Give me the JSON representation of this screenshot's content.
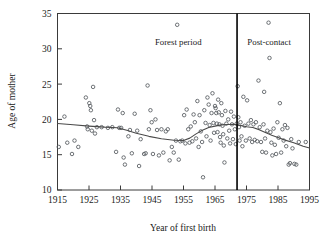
{
  "chart_data": {
    "type": "scatter",
    "title": "",
    "xlabel": "Year of first birth",
    "ylabel": "Age of mother",
    "xlim": [
      1915,
      1995
    ],
    "ylim": [
      10,
      35
    ],
    "xticks": [
      1915,
      1925,
      1935,
      1945,
      1955,
      1965,
      1975,
      1985,
      1995
    ],
    "xtick_labels": [
      "1915",
      "1925",
      "1935",
      "1945",
      "1955",
      "1965",
      "1975",
      "1985",
      "1995"
    ],
    "yticks": [
      10,
      15,
      20,
      25,
      30,
      35
    ],
    "ytick_labels": [
      "10",
      "15",
      "20",
      "25",
      "30",
      "35"
    ],
    "grid": false,
    "legend": "none",
    "marker": "open-circle",
    "annotations": [
      {
        "name": "forest-period-label",
        "text": "Forest period",
        "x": 1962,
        "y": 30.6,
        "align": "end"
      },
      {
        "name": "post-contact-label",
        "text": "Post-contact",
        "x": 1974,
        "y": 30.6,
        "align": "start"
      }
    ],
    "vline": {
      "name": "period-divider",
      "x": 1972,
      "label": "period boundary"
    },
    "series": [
      {
        "name": "Age of mother at first birth",
        "points": [
          [
            1915.4,
            16.1
          ],
          [
            1917.2,
            20.4
          ],
          [
            1918.1,
            16.7
          ],
          [
            1919.6,
            15.1
          ],
          [
            1920.4,
            17.0
          ],
          [
            1921.6,
            16.1
          ],
          [
            1924.0,
            23.1
          ],
          [
            1924.4,
            19.0
          ],
          [
            1924.6,
            18.6
          ],
          [
            1925.1,
            22.3
          ],
          [
            1925.4,
            21.9
          ],
          [
            1925.6,
            21.3
          ],
          [
            1925.9,
            18.4
          ],
          [
            1926.3,
            24.6
          ],
          [
            1926.6,
            19.9
          ],
          [
            1926.9,
            18.0
          ],
          [
            1927.5,
            18.9
          ],
          [
            1929.0,
            18.9
          ],
          [
            1931.0,
            18.8
          ],
          [
            1932.4,
            18.9
          ],
          [
            1933.6,
            15.4
          ],
          [
            1934.2,
            21.4
          ],
          [
            1934.6,
            18.8
          ],
          [
            1935.2,
            18.8
          ],
          [
            1935.7,
            20.9
          ],
          [
            1936.0,
            14.6
          ],
          [
            1936.4,
            13.6
          ],
          [
            1937.5,
            17.6
          ],
          [
            1938.0,
            18.5
          ],
          [
            1938.6,
            15.2
          ],
          [
            1939.5,
            20.8
          ],
          [
            1940.3,
            18.4
          ],
          [
            1940.9,
            13.4
          ],
          [
            1941.4,
            17.2
          ],
          [
            1942.5,
            15.1
          ],
          [
            1943.0,
            15.2
          ],
          [
            1943.6,
            24.8
          ],
          [
            1944.0,
            18.6
          ],
          [
            1944.5,
            21.3
          ],
          [
            1944.9,
            19.6
          ],
          [
            1945.3,
            15.1
          ],
          [
            1946.1,
            20.0
          ],
          [
            1946.6,
            18.5
          ],
          [
            1947.2,
            14.9
          ],
          [
            1948.0,
            18.6
          ],
          [
            1948.6,
            15.3
          ],
          [
            1949.4,
            18.3
          ],
          [
            1950.0,
            18.6
          ],
          [
            1950.6,
            14.2
          ],
          [
            1951.3,
            16.1
          ],
          [
            1951.9,
            15.3
          ],
          [
            1952.6,
            17.0
          ],
          [
            1953.0,
            33.4
          ],
          [
            1953.5,
            14.3
          ],
          [
            1954.0,
            16.9
          ],
          [
            1954.6,
            17.0
          ],
          [
            1955.2,
            20.6
          ],
          [
            1955.6,
            16.6
          ],
          [
            1956.0,
            21.4
          ],
          [
            1956.5,
            18.6
          ],
          [
            1956.9,
            16.7
          ],
          [
            1957.3,
            19.0
          ],
          [
            1957.8,
            16.9
          ],
          [
            1958.2,
            20.7
          ],
          [
            1958.6,
            19.6
          ],
          [
            1959.0,
            17.3
          ],
          [
            1959.4,
            22.6
          ],
          [
            1959.8,
            16.1
          ],
          [
            1960.1,
            20.6
          ],
          [
            1960.5,
            18.3
          ],
          [
            1960.9,
            16.8
          ],
          [
            1961.2,
            11.8
          ],
          [
            1961.6,
            21.3
          ],
          [
            1962.0,
            19.5
          ],
          [
            1962.3,
            17.6
          ],
          [
            1962.6,
            23.1
          ],
          [
            1963.0,
            22.1
          ],
          [
            1963.3,
            19.2
          ],
          [
            1963.6,
            17.0
          ],
          [
            1963.9,
            20.9
          ],
          [
            1964.2,
            23.7
          ],
          [
            1964.5,
            19.5
          ],
          [
            1964.7,
            18.1
          ],
          [
            1965.0,
            21.9
          ],
          [
            1965.2,
            21.6
          ],
          [
            1965.4,
            20.9
          ],
          [
            1965.6,
            19.4
          ],
          [
            1965.8,
            18.2
          ],
          [
            1966.0,
            22.8
          ],
          [
            1966.2,
            21.0
          ],
          [
            1966.4,
            19.3
          ],
          [
            1966.6,
            17.5
          ],
          [
            1966.8,
            16.7
          ],
          [
            1967.0,
            22.3
          ],
          [
            1967.2,
            20.6
          ],
          [
            1967.4,
            19.1
          ],
          [
            1967.6,
            17.9
          ],
          [
            1967.8,
            16.3
          ],
          [
            1968.0,
            13.9
          ],
          [
            1968.3,
            21.2
          ],
          [
            1968.6,
            19.4
          ],
          [
            1968.9,
            17.3
          ],
          [
            1969.2,
            20.0
          ],
          [
            1969.5,
            18.4
          ],
          [
            1969.8,
            16.6
          ],
          [
            1970.1,
            21.1
          ],
          [
            1970.4,
            19.3
          ],
          [
            1970.7,
            17.2
          ],
          [
            1971.0,
            20.4
          ],
          [
            1971.3,
            18.6
          ],
          [
            1971.6,
            16.5
          ],
          [
            1971.9,
            19.4
          ],
          [
            1972.2,
            24.7
          ],
          [
            1972.4,
            20.3
          ],
          [
            1972.6,
            18.9
          ],
          [
            1972.8,
            17.0
          ],
          [
            1973.1,
            19.6
          ],
          [
            1973.4,
            17.6
          ],
          [
            1973.7,
            16.2
          ],
          [
            1974.0,
            23.2
          ],
          [
            1974.4,
            19.1
          ],
          [
            1974.8,
            17.0
          ],
          [
            1975.2,
            22.7
          ],
          [
            1975.6,
            19.4
          ],
          [
            1976.0,
            17.3
          ],
          [
            1976.4,
            19.9
          ],
          [
            1976.8,
            16.8
          ],
          [
            1977.2,
            19.3
          ],
          [
            1977.6,
            17.1
          ],
          [
            1978.0,
            19.6
          ],
          [
            1978.4,
            16.9
          ],
          [
            1978.8,
            25.5
          ],
          [
            1979.2,
            18.9
          ],
          [
            1979.6,
            16.8
          ],
          [
            1980.0,
            15.4
          ],
          [
            1980.4,
            19.3
          ],
          [
            1980.6,
            23.9
          ],
          [
            1980.9,
            17.3
          ],
          [
            1981.2,
            15.3
          ],
          [
            1981.6,
            18.4
          ],
          [
            1982.0,
            33.7
          ],
          [
            1982.3,
            28.7
          ],
          [
            1982.6,
            18.2
          ],
          [
            1982.9,
            16.7
          ],
          [
            1983.2,
            14.9
          ],
          [
            1983.6,
            18.7
          ],
          [
            1984.0,
            16.4
          ],
          [
            1984.4,
            15.1
          ],
          [
            1984.8,
            19.6
          ],
          [
            1985.2,
            17.4
          ],
          [
            1985.6,
            22.3
          ],
          [
            1986.0,
            15.3
          ],
          [
            1986.4,
            18.6
          ],
          [
            1986.8,
            17.0
          ],
          [
            1987.2,
            19.2
          ],
          [
            1987.6,
            16.2
          ],
          [
            1988.0,
            18.8
          ],
          [
            1988.4,
            13.6
          ],
          [
            1988.8,
            13.8
          ],
          [
            1989.2,
            17.2
          ],
          [
            1989.6,
            15.9
          ],
          [
            1990.2,
            13.7
          ],
          [
            1990.8,
            13.6
          ],
          [
            1991.6,
            16.8
          ],
          [
            1993.8,
            16.8
          ]
        ]
      }
    ],
    "trend_line": {
      "name": "smoothed-trend",
      "points": [
        [
          1915,
          19.42
        ],
        [
          1920,
          19.25
        ],
        [
          1925,
          19.05
        ],
        [
          1930,
          18.9
        ],
        [
          1934,
          18.82
        ],
        [
          1937,
          18.45
        ],
        [
          1940,
          18.05
        ],
        [
          1944,
          17.6
        ],
        [
          1948,
          17.25
        ],
        [
          1952,
          17.05
        ],
        [
          1955,
          17.02
        ],
        [
          1957,
          17.35
        ],
        [
          1959,
          17.95
        ],
        [
          1961,
          18.45
        ],
        [
          1963,
          18.85
        ],
        [
          1965,
          19.05
        ],
        [
          1967,
          19.22
        ],
        [
          1969,
          19.28
        ],
        [
          1971,
          19.3
        ],
        [
          1973,
          19.15
        ],
        [
          1975,
          18.95
        ],
        [
          1977,
          18.85
        ],
        [
          1979,
          18.55
        ],
        [
          1981,
          18.15
        ],
        [
          1983,
          17.75
        ],
        [
          1985,
          17.45
        ],
        [
          1987,
          17.1
        ],
        [
          1990,
          16.7
        ],
        [
          1993,
          16.2
        ],
        [
          1995,
          15.95
        ]
      ]
    }
  }
}
